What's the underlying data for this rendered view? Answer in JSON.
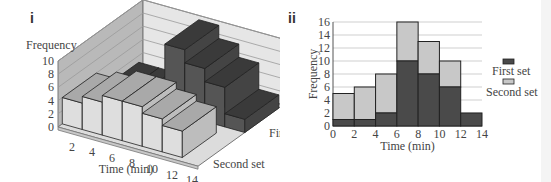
{
  "chart_data": [
    {
      "panel": "i",
      "type": "bar",
      "style": "3d-grouped",
      "title": "",
      "xlabel": "Time (min)",
      "ylabel": "Frequency",
      "depth_label_front": "Second set",
      "depth_label_back": "First set",
      "x_ticks": [
        "2",
        "4",
        "6",
        "8",
        "10",
        "12",
        "14"
      ],
      "y_ticks": [
        "0",
        "2",
        "4",
        "6",
        "8",
        "10"
      ],
      "ylim": [
        0,
        10
      ],
      "categories": [
        "0-2",
        "2-4",
        "4-6",
        "6-8",
        "8-10",
        "10-12",
        "12-14"
      ],
      "series": [
        {
          "name": "First set",
          "values": [
            1,
            1,
            2,
            10,
            8,
            6,
            2
          ],
          "color": "#4a4a4a"
        },
        {
          "name": "Second set",
          "values": [
            4,
            5,
            6,
            6,
            5,
            4,
            0
          ],
          "color": "#d4d4d4"
        }
      ]
    },
    {
      "panel": "ii",
      "type": "bar",
      "style": "stacked-histogram",
      "title": "",
      "xlabel": "Time (min)",
      "ylabel": "Frequency",
      "x_ticks": [
        "0",
        "2",
        "4",
        "6",
        "8",
        "10",
        "12",
        "14"
      ],
      "y_ticks": [
        "0",
        "2",
        "4",
        "6",
        "8",
        "10",
        "12",
        "14",
        "16"
      ],
      "ylim": [
        0,
        16
      ],
      "grid": true,
      "legend_position": "right",
      "categories": [
        "0-2",
        "2-4",
        "4-6",
        "6-8",
        "8-10",
        "10-12",
        "12-14"
      ],
      "series": [
        {
          "name": "First set",
          "values": [
            1,
            1,
            2,
            10,
            8,
            6,
            2
          ],
          "color": "#4a4a4a"
        },
        {
          "name": "Second set",
          "values": [
            4,
            5,
            6,
            6,
            5,
            4,
            0
          ],
          "color": "#c8c8c8"
        }
      ],
      "totals": [
        5,
        6,
        8,
        16,
        13,
        10,
        2
      ]
    }
  ],
  "labels": {
    "panel_i": "i",
    "panel_ii": "ii",
    "frequency": "Frequency",
    "time": "Time (min)",
    "first_set": "First set",
    "second_set": "Second set"
  }
}
